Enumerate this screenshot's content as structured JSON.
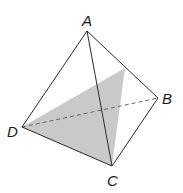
{
  "figure": {
    "type": "tetrahedron",
    "vertices": {
      "A": {
        "label": "A",
        "x": 87,
        "y": 31
      },
      "B": {
        "label": "B",
        "x": 158,
        "y": 98
      },
      "C": {
        "label": "C",
        "x": 112,
        "y": 166
      },
      "D": {
        "label": "D",
        "x": 22,
        "y": 127
      }
    },
    "section_point": {
      "x": 125,
      "y": 68
    },
    "colors": {
      "edge": "#2a2a2a",
      "hidden_edge": "#555555",
      "shade": "#c9c9c9"
    }
  }
}
